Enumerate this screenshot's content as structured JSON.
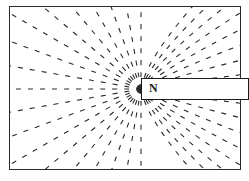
{
  "diagram": {
    "magnet": {
      "pole_label": "N"
    },
    "field_line_style": "dashed",
    "colors": {
      "line": "#2a2a2a",
      "background": "#ffffff"
    }
  }
}
